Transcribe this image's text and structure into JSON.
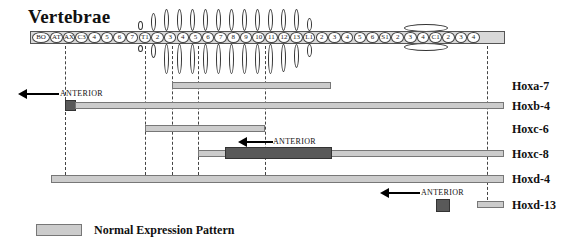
{
  "title": "Vertebrae",
  "vertebrae": [
    "BO",
    "AT",
    "AX",
    "C3",
    "4",
    "5",
    "6",
    "7",
    "T1",
    "2",
    "3",
    "4",
    "5",
    "6",
    "7",
    "8",
    "9",
    "10",
    "11",
    "12",
    "13",
    "L1",
    "2",
    "3",
    "4",
    "5",
    "6",
    "S1",
    "2",
    "3",
    "4",
    "C1",
    "2",
    "3",
    "4"
  ],
  "genes": [
    {
      "name": "Hoxa-7"
    },
    {
      "name": "Hoxb-4"
    },
    {
      "name": "Hoxc-6"
    },
    {
      "name": "Hoxc-8"
    },
    {
      "name": "Hoxd-4"
    },
    {
      "name": "Hoxd-13"
    }
  ],
  "annotations": {
    "anterior_b4": "ANTERIOR",
    "anterior_c8": "ANTERIOR",
    "anterior_d13": "ANTERIOR"
  },
  "legend": {
    "normal_label": "Normal Expression Pattern"
  },
  "colors": {
    "normal_bar": "#cccccc",
    "shifted_bar": "#595959",
    "row_fill": "#d8d8d8"
  }
}
